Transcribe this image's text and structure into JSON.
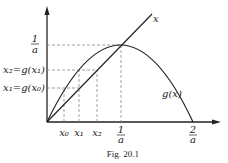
{
  "figure": {
    "caption": "Fig. 20.1",
    "line_label": "x",
    "curve_label": "g(x)",
    "y_labels": {
      "one_over_a_num": "1",
      "one_over_a_den": "a",
      "x2": "x₂=g(x₁)",
      "x1": "x₁=g(x₀)"
    },
    "x_labels": {
      "x0": "x₀",
      "x1": "x₁",
      "x2": "x₂",
      "one_over_a_num": "1",
      "one_over_a_den": "a",
      "two_over_a_num": "2",
      "two_over_a_den": "a"
    },
    "colors": {
      "ink": "#222222",
      "dash": "#888888"
    }
  }
}
